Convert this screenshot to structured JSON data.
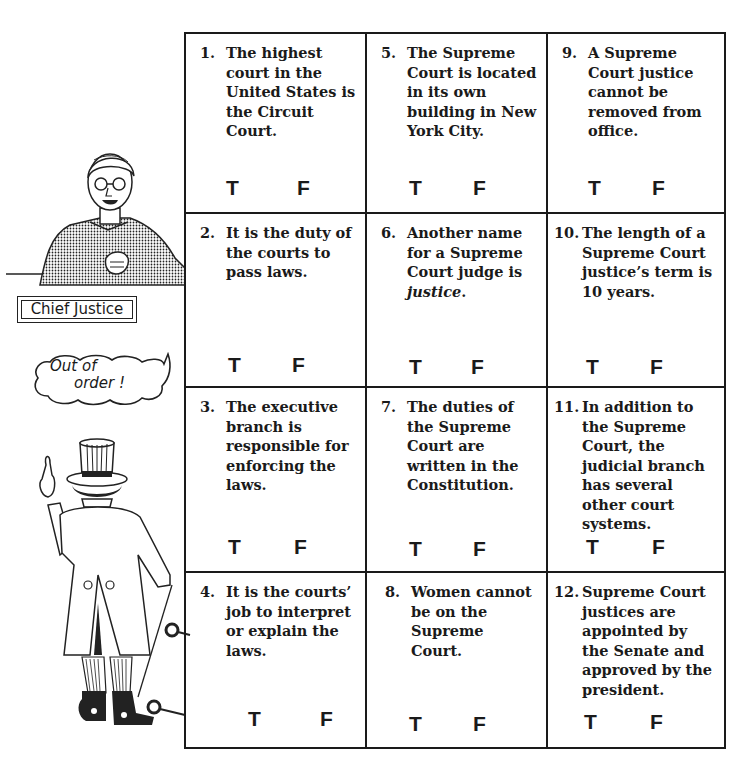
{
  "worksheet": {
    "questions": [
      {
        "num": "1.",
        "text": "The highest court in the United States is the Circuit Court.",
        "true_label": "T",
        "false_label": "F"
      },
      {
        "num": "2.",
        "text": "It is the duty of the courts to pass laws.",
        "true_label": "T",
        "false_label": "F"
      },
      {
        "num": "3.",
        "text": "The executive branch is responsible for enforcing the laws.",
        "true_label": "T",
        "false_label": "F"
      },
      {
        "num": "4.",
        "text": "It is the courts’ job to interpret or explain the laws.",
        "true_label": "T",
        "false_label": "F"
      },
      {
        "num": "5.",
        "text": "The Supreme Court is located in its own building in New York City.",
        "true_label": "T",
        "false_label": "F"
      },
      {
        "num": "6.",
        "text_before": "Another name for a Supreme Court judge is ",
        "text_italic": "justice",
        "text_after": ".",
        "true_label": "T",
        "false_label": "F"
      },
      {
        "num": "7.",
        "text": "The duties of the Supreme Court are written in the Constitution.",
        "true_label": "T",
        "false_label": "F"
      },
      {
        "num": "8.",
        "text": "Women cannot be on the Supreme Court.",
        "true_label": "T",
        "false_label": "F"
      },
      {
        "num": "9.",
        "text": "A Supreme Court justice cannot be removed from office.",
        "true_label": "T",
        "false_label": "F"
      },
      {
        "num": "10.",
        "text": "The length of a Supreme Court justice’s term is 10 years.",
        "true_label": "T",
        "false_label": "F"
      },
      {
        "num": "11.",
        "text": "In addition to the Supreme Court, the judicial branch has several other court systems.",
        "true_label": "T",
        "false_label": "F"
      },
      {
        "num": "12.",
        "text": "Supreme Court justices are appointed by the Senate and approved by the president.",
        "true_label": "T",
        "false_label": "F"
      }
    ]
  },
  "illustrations": {
    "chief_justice_label": "Chief Justice",
    "speech_bubble_line1": "Out of",
    "speech_bubble_line2": "order !"
  },
  "colors": {
    "ink": "#1a1a1a",
    "paper": "#ffffff"
  }
}
